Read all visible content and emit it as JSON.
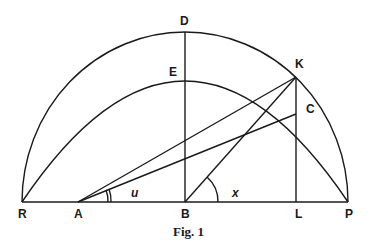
{
  "figure": {
    "caption": "Fig. 1",
    "points": {
      "R": "R",
      "A": "A",
      "B": "B",
      "L": "L",
      "P": "P",
      "D": "D",
      "E": "E",
      "K": "K",
      "C": "C"
    },
    "angles": {
      "u": "u",
      "x": "x"
    }
  }
}
